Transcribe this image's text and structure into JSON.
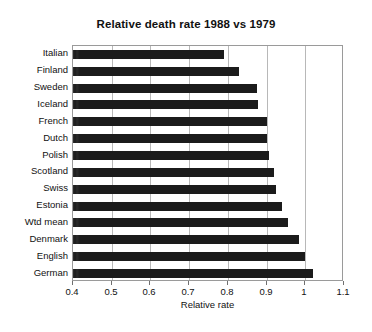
{
  "chart_data": {
    "type": "bar",
    "orientation": "horizontal",
    "title": "Relative death rate 1988 vs 1979",
    "xlabel": "Relative rate",
    "ylabel": "",
    "xlim": [
      0.4,
      1.1
    ],
    "xticks": [
      "0.4",
      "0.5",
      "0.6",
      "0.7",
      "0.8",
      "0.9",
      "1",
      "1.1"
    ],
    "xtick_values": [
      0.4,
      0.5,
      0.6,
      0.7,
      0.8,
      0.9,
      1.0,
      1.1
    ],
    "grid": "vertical",
    "legend": "none",
    "bar_color": "#1b1b1b",
    "categories": [
      "Italian",
      "Finland",
      "Sweden",
      "Iceland",
      "French",
      "Dutch",
      "Polish",
      "Scotland",
      "Swiss",
      "Estonia",
      "Wtd mean",
      "Denmark",
      "English",
      "German"
    ],
    "values": [
      0.79,
      0.83,
      0.875,
      0.878,
      0.9,
      0.9,
      0.905,
      0.92,
      0.925,
      0.94,
      0.955,
      0.985,
      1.0,
      1.02
    ]
  }
}
